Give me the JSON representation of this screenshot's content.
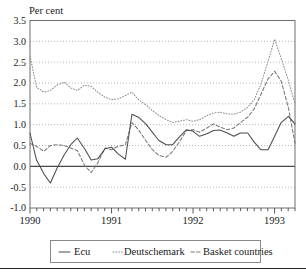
{
  "chart_data": {
    "type": "line",
    "title": "",
    "ylabel": "Per cent",
    "xlabel": "",
    "ylim": [
      -1.0,
      3.5
    ],
    "xlim": [
      1990.0,
      1993.25
    ],
    "grid": true,
    "legend_position": "below",
    "y_ticks": [
      "3.5",
      "3.0",
      "2.5",
      "2.0",
      "1.5",
      "1.0",
      "0.5",
      "0.0",
      "-0.5",
      "-1.0"
    ],
    "y_tick_values": [
      3.5,
      3.0,
      2.5,
      2.0,
      1.5,
      1.0,
      0.5,
      0.0,
      -0.5,
      -1.0
    ],
    "x_ticks": [
      "1990",
      "1991",
      "1992",
      "1993"
    ],
    "x_tick_values": [
      1990,
      1991,
      1992,
      1993
    ],
    "x_minor_tick_interval": 0.08333,
    "series": [
      {
        "name": "Ecu",
        "style": "solid",
        "color": "#4d4d4d",
        "x": [
          1990.0,
          1990.08,
          1990.17,
          1990.25,
          1990.33,
          1990.42,
          1990.5,
          1990.58,
          1990.67,
          1990.75,
          1990.83,
          1990.92,
          1991.0,
          1991.08,
          1991.17,
          1991.25,
          1991.33,
          1991.42,
          1991.5,
          1991.58,
          1991.67,
          1991.75,
          1991.83,
          1991.92,
          1992.0,
          1992.08,
          1992.17,
          1992.25,
          1992.33,
          1992.42,
          1992.5,
          1992.58,
          1992.67,
          1992.75,
          1992.83,
          1992.92,
          1993.0,
          1993.08,
          1993.17,
          1993.25
        ],
        "values": [
          0.8,
          0.15,
          -0.18,
          -0.4,
          -0.05,
          0.28,
          0.52,
          0.68,
          0.42,
          0.15,
          0.18,
          0.42,
          0.46,
          0.3,
          0.17,
          1.25,
          1.18,
          1.02,
          0.82,
          0.62,
          0.52,
          0.52,
          0.7,
          0.88,
          0.84,
          0.72,
          0.78,
          0.86,
          0.87,
          0.8,
          0.72,
          0.8,
          0.8,
          0.58,
          0.4,
          0.4,
          0.72,
          1.05,
          1.2,
          1.02
        ]
      },
      {
        "name": "Deutschemark",
        "style": "dotted",
        "color": "#8e8e8e",
        "x": [
          1990.0,
          1990.08,
          1990.17,
          1990.25,
          1990.33,
          1990.42,
          1990.5,
          1990.58,
          1990.67,
          1990.75,
          1990.83,
          1990.92,
          1991.0,
          1991.08,
          1991.17,
          1991.25,
          1991.33,
          1991.42,
          1991.5,
          1991.58,
          1991.67,
          1991.75,
          1991.83,
          1991.92,
          1992.0,
          1992.08,
          1992.17,
          1992.25,
          1992.33,
          1992.42,
          1992.5,
          1992.58,
          1992.67,
          1992.75,
          1992.83,
          1992.92,
          1993.0,
          1993.08,
          1993.17,
          1993.25
        ],
        "values": [
          2.65,
          1.9,
          1.78,
          1.82,
          1.95,
          2.02,
          1.88,
          1.82,
          1.95,
          1.92,
          1.78,
          1.66,
          1.6,
          1.62,
          1.7,
          1.78,
          1.6,
          1.48,
          1.34,
          1.22,
          1.12,
          1.05,
          1.08,
          1.12,
          1.08,
          1.12,
          1.22,
          1.28,
          1.3,
          1.26,
          1.25,
          1.3,
          1.42,
          1.6,
          1.96,
          2.52,
          3.05,
          2.6,
          2.05,
          1.5
        ]
      },
      {
        "name": "Basket countries",
        "style": "dashed",
        "color": "#777777",
        "x": [
          1990.0,
          1990.08,
          1990.17,
          1990.25,
          1990.33,
          1990.42,
          1990.5,
          1990.58,
          1990.67,
          1990.75,
          1990.83,
          1990.92,
          1991.0,
          1991.08,
          1991.17,
          1991.25,
          1991.33,
          1991.42,
          1991.5,
          1991.58,
          1991.67,
          1991.75,
          1991.83,
          1991.92,
          1992.0,
          1992.08,
          1992.17,
          1992.25,
          1992.33,
          1992.42,
          1992.5,
          1992.58,
          1992.67,
          1992.75,
          1992.83,
          1992.92,
          1993.0,
          1993.08,
          1993.17,
          1993.25
        ],
        "values": [
          0.55,
          0.48,
          0.36,
          0.5,
          0.52,
          0.5,
          0.44,
          0.38,
          0.02,
          -0.15,
          0.08,
          0.44,
          0.4,
          0.48,
          0.52,
          1.05,
          0.88,
          0.62,
          0.4,
          0.26,
          0.22,
          0.36,
          0.58,
          0.86,
          0.88,
          0.82,
          0.92,
          1.02,
          0.94,
          0.88,
          0.92,
          1.05,
          1.18,
          1.38,
          1.72,
          2.1,
          2.28,
          2.05,
          1.4,
          0.55
        ]
      }
    ]
  },
  "legend": {
    "items": [
      {
        "label": "Ecu",
        "marker": "solid-line-swatch"
      },
      {
        "label": "Deutschemark",
        "marker": "dotted-line-swatch"
      },
      {
        "label": "Basket countries",
        "marker": "dashed-line-swatch"
      }
    ]
  }
}
